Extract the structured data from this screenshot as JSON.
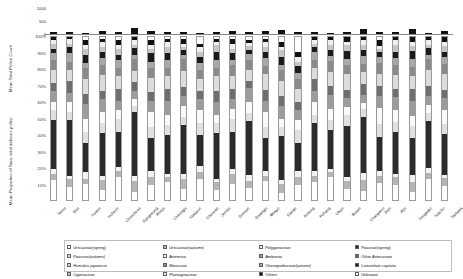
{
  "axis_titles": {
    "top": "Mean Total Pollen Count",
    "bottom": "Mean Proportion of Taxa- total airborne pollen"
  },
  "chart_data": {
    "type": "bar",
    "title": "",
    "subtitle": "",
    "xlabel": "",
    "ylabel": "Mean Proportion of Taxa- total airborne pollen",
    "grid": false,
    "legend_position": "bottom",
    "panels": [
      {
        "name": "mean-total-pollen-count",
        "type": "bar",
        "ylabel": "Mean Total Pollen Count",
        "ylim": [
          0,
          1000
        ],
        "yticks": [
          0,
          500,
          1000
        ],
        "ytick_labels": [
          "0",
          "500",
          "1000"
        ],
        "values": [
          62,
          70,
          48,
          120,
          85,
          250,
          110,
          95,
          68,
          52,
          80,
          105,
          60,
          115,
          150,
          72,
          88,
          58,
          66,
          210,
          95,
          74,
          180,
          45,
          130
        ]
      },
      {
        "name": "mean-proportion-of-taxa",
        "type": "bar",
        "stacked": true,
        "normalized": true,
        "ylabel": "Mean Proportion of Taxa- total airborne pollen",
        "ylim": [
          0,
          100
        ],
        "yticks": [
          10,
          20,
          30,
          40,
          50,
          60,
          70,
          80,
          90,
          100
        ],
        "ytick_labels": [
          "10%",
          "20%",
          "30%",
          "40%",
          "50%",
          "60%",
          "70%",
          "80%",
          "90%",
          "100%"
        ]
      }
    ],
    "categories": [
      "Seoul",
      "Guri",
      "Suwon",
      "Incheon",
      "Chuncheon",
      "Gangneung",
      "Wonju",
      "Cheongju",
      "Daejeon",
      "Cheonan",
      "Jeonju",
      "Gunsan",
      "Gwangju",
      "Mokpo",
      "Daegu",
      "Andong",
      "Pohang",
      "Ulsan",
      "Busan",
      "Changwon",
      "Jinju",
      "Jeju",
      "Seogwipo",
      "Sokcho",
      "Taebaek"
    ],
    "series": [
      {
        "name": "Urticaceae(spring)",
        "color": "#ffffff",
        "values": [
          12,
          8,
          10,
          6,
          14,
          5,
          9,
          11,
          7,
          13,
          6,
          10,
          8,
          12,
          4,
          9,
          11,
          15,
          7,
          6,
          10,
          9,
          5,
          13,
          8
        ]
      },
      {
        "name": "Urticaceae(autumn)",
        "color": "#b5b5b5",
        "values": [
          4,
          5,
          3,
          6,
          4,
          7,
          5,
          3,
          6,
          4,
          5,
          6,
          4,
          3,
          6,
          5,
          4,
          3,
          5,
          7,
          4,
          5,
          6,
          4,
          5
        ]
      },
      {
        "name": "Polygonaceae",
        "color": "#f2f2f2",
        "values": [
          3,
          2,
          4,
          3,
          2,
          3,
          4,
          2,
          3,
          4,
          2,
          3,
          4,
          3,
          2,
          4,
          3,
          2,
          3,
          4,
          3,
          2,
          4,
          3,
          2
        ]
      },
      {
        "name": "Poaceae(spring)",
        "color": "#2b2b2b",
        "values": [
          30,
          34,
          18,
          26,
          22,
          40,
          20,
          24,
          31,
          19,
          28,
          23,
          35,
          21,
          27,
          17,
          29,
          25,
          33,
          36,
          20,
          26,
          22,
          30,
          24
        ]
      },
      {
        "name": "Poaceae(autumn)",
        "color": "#e0e0e0",
        "values": [
          6,
          5,
          7,
          6,
          8,
          4,
          7,
          6,
          5,
          7,
          6,
          8,
          5,
          7,
          6,
          8,
          5,
          6,
          7,
          5,
          8,
          6,
          7,
          5,
          6
        ]
      },
      {
        "name": "Artemisia",
        "color": "#fafafa",
        "values": [
          5,
          6,
          8,
          7,
          5,
          4,
          9,
          6,
          7,
          8,
          5,
          6,
          7,
          9,
          5,
          6,
          8,
          7,
          5,
          4,
          9,
          7,
          6,
          5,
          8
        ]
      },
      {
        "name": "Ambrosia",
        "color": "#9c9c9c",
        "values": [
          7,
          6,
          9,
          8,
          6,
          5,
          7,
          9,
          6,
          7,
          8,
          6,
          9,
          7,
          8,
          6,
          7,
          9,
          6,
          5,
          7,
          8,
          9,
          6,
          7
        ]
      },
      {
        "name": "Other Asteraceae",
        "color": "#6e6e6e",
        "values": [
          5,
          7,
          6,
          5,
          7,
          6,
          5,
          7,
          6,
          5,
          7,
          6,
          5,
          7,
          6,
          5,
          7,
          6,
          5,
          7,
          6,
          5,
          7,
          6,
          5
        ]
      },
      {
        "name": "Humulus japonicus",
        "color": "#dcdcdc",
        "values": [
          8,
          7,
          9,
          10,
          8,
          7,
          9,
          8,
          10,
          7,
          9,
          8,
          7,
          10,
          9,
          8,
          7,
          9,
          10,
          8,
          7,
          9,
          8,
          10,
          9
        ]
      },
      {
        "name": "Moraceae",
        "color": "#8a8a8a",
        "values": [
          6,
          5,
          7,
          6,
          5,
          7,
          6,
          5,
          7,
          6,
          5,
          7,
          6,
          5,
          7,
          6,
          5,
          7,
          6,
          5,
          7,
          6,
          5,
          7,
          6
        ]
      },
      {
        "name": "Chenopodiaceae(autumn)",
        "color": "#a8a8a8",
        "values": [
          4,
          5,
          3,
          4,
          5,
          3,
          4,
          5,
          3,
          4,
          5,
          3,
          4,
          5,
          3,
          4,
          5,
          3,
          4,
          5,
          3,
          4,
          5,
          3,
          4
        ]
      },
      {
        "name": "Lanceolate capitata",
        "color": "#1a1a1a",
        "values": [
          3,
          4,
          5,
          4,
          3,
          4,
          5,
          4,
          3,
          4,
          5,
          4,
          3,
          4,
          5,
          4,
          3,
          4,
          5,
          4,
          3,
          4,
          5,
          4,
          3
        ]
      },
      {
        "name": "Cyperaceae",
        "color": "#c6c6c6",
        "values": [
          3,
          2,
          4,
          3,
          4,
          2,
          3,
          4,
          2,
          3,
          4,
          3,
          2,
          3,
          4,
          3,
          2,
          3,
          4,
          3,
          2,
          4,
          3,
          2,
          4
        ]
      },
      {
        "name": "Plantaginaceae",
        "color": "#efefef",
        "values": [
          2,
          3,
          2,
          3,
          2,
          3,
          2,
          3,
          2,
          3,
          2,
          3,
          2,
          3,
          2,
          3,
          2,
          3,
          2,
          3,
          2,
          3,
          2,
          3,
          2
        ]
      },
      {
        "name": "Others",
        "color": "#111111",
        "values": [
          2,
          1,
          3,
          2,
          3,
          2,
          3,
          2,
          3,
          2,
          2,
          3,
          2,
          2,
          3,
          3,
          2,
          2,
          3,
          2,
          3,
          2,
          3,
          2,
          3
        ]
      },
      {
        "name": "Unknown",
        "color": "#ffffff",
        "values": [
          0,
          0,
          2,
          1,
          2,
          0,
          2,
          1,
          1,
          4,
          1,
          1,
          2,
          1,
          3,
          9,
          0,
          0,
          0,
          0,
          2,
          0,
          0,
          0,
          0
        ]
      }
    ]
  },
  "legend": {
    "items": [
      {
        "label": "Urticaceae(spring)"
      },
      {
        "label": "Urticaceae(autumn)"
      },
      {
        "label": "Polygonaceae"
      },
      {
        "label": "Poaceae(spring)"
      },
      {
        "label": "Poaceae(autumn)"
      },
      {
        "label": "Artemisia"
      },
      {
        "label": "Ambrosia"
      },
      {
        "label": "Other Asteraceae"
      },
      {
        "label": "Humulus japonicus"
      },
      {
        "label": "Moraceae"
      },
      {
        "label": "Chenopodiaceae(autumn)"
      },
      {
        "label": "Lanceolate capitata"
      },
      {
        "label": "Cyperaceae"
      },
      {
        "label": "Plantaginaceae"
      },
      {
        "label": "Others"
      },
      {
        "label": "Unknown"
      }
    ]
  }
}
